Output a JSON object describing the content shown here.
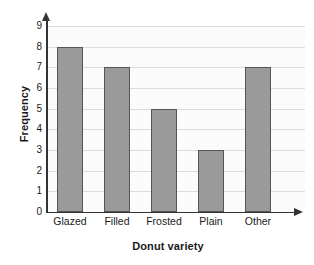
{
  "chart_data": {
    "type": "bar",
    "title": "",
    "categories": [
      "Glazed",
      "Filled",
      "Frosted",
      "Plain",
      "Other"
    ],
    "values": [
      8,
      7,
      5,
      3,
      7
    ],
    "xlabel": "Donut variety",
    "ylabel": "Frequency",
    "ylim": [
      0,
      9
    ],
    "ytick_labels": [
      "0",
      "1",
      "2",
      "3",
      "4",
      "5",
      "6",
      "7",
      "8",
      "9"
    ],
    "grid": true,
    "legend": "none",
    "colors": {
      "bar_fill": "#9a9a9a",
      "bar_border": "#555555",
      "axis": "#333333",
      "gridline": "#dcdcdc",
      "plot_background": "#fbfbfb",
      "text": "#1a1a1a"
    }
  }
}
